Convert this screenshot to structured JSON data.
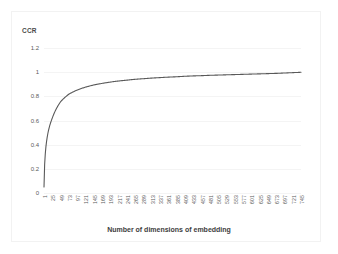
{
  "chart_data": {
    "type": "line",
    "title": "",
    "ylabel": "CCR",
    "xlabel": "Number of dimensions of embedding",
    "ylim": [
      0,
      1.2
    ],
    "yticks": [
      "0",
      "0.2",
      "0.4",
      "0.6",
      "0.8",
      "1",
      "1.2"
    ],
    "ytick_values": [
      0,
      0.2,
      0.4,
      0.6,
      0.8,
      1,
      1.2
    ],
    "grid": true,
    "legend": "none",
    "line_color": "#595959",
    "categories": [
      "1",
      "25",
      "49",
      "73",
      "97",
      "121",
      "145",
      "169",
      "193",
      "217",
      "241",
      "265",
      "289",
      "313",
      "337",
      "361",
      "385",
      "409",
      "433",
      "457",
      "481",
      "505",
      "529",
      "553",
      "577",
      "601",
      "625",
      "649",
      "673",
      "697",
      "721",
      "745"
    ],
    "x": [
      1,
      25,
      49,
      73,
      97,
      121,
      145,
      169,
      193,
      217,
      241,
      265,
      289,
      313,
      337,
      361,
      385,
      409,
      433,
      457,
      481,
      505,
      529,
      553,
      577,
      601,
      625,
      649,
      673,
      697,
      721,
      745
    ],
    "values": [
      0.05,
      0.62,
      0.755,
      0.818,
      0.852,
      0.876,
      0.894,
      0.907,
      0.918,
      0.927,
      0.934,
      0.941,
      0.946,
      0.951,
      0.955,
      0.959,
      0.962,
      0.966,
      0.969,
      0.971,
      0.974,
      0.976,
      0.978,
      0.98,
      0.982,
      0.984,
      0.986,
      0.988,
      0.99,
      0.993,
      0.996,
      0.999
    ]
  },
  "axis": {
    "y_label": "CCR",
    "x_label": "Number of dimensions of embedding"
  }
}
